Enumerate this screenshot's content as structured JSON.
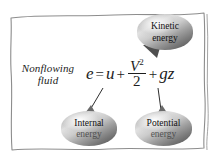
{
  "figure": {
    "name": "nonflowing-fluid-energy-diagram",
    "border_color": "#8a8a8a",
    "background": "#ffffff"
  },
  "label": {
    "line1": "Nonflowing",
    "line2": "fluid"
  },
  "equation": {
    "lhs": "e",
    "equals": "=",
    "term_internal": "u",
    "plus1": "+",
    "numerator_base": "V",
    "numerator_exponent": "2",
    "denominator": "2",
    "plus2": "+",
    "term_potential": "gz",
    "full_text": "e = u + V²/2 + gz"
  },
  "callouts": [
    {
      "id": "kinetic",
      "line1": "Kinetic",
      "line2": "energy",
      "points_to": "V²/2",
      "fill_dark": "#555555",
      "fill_light": "#e3e3e3"
    },
    {
      "id": "internal",
      "line1": "Internal",
      "line2": "energy",
      "points_to": "u",
      "fill_dark": "#555555",
      "fill_light": "#e3e3e3"
    },
    {
      "id": "potential",
      "line1": "Potential",
      "line2": "energy",
      "points_to": "gz",
      "fill_dark": "#555555",
      "fill_light": "#e3e3e3"
    }
  ]
}
